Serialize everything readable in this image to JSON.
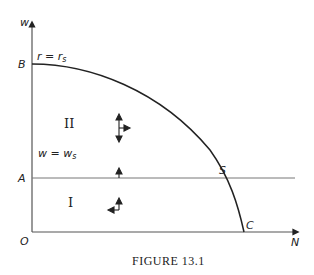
{
  "figure": {
    "caption": "FIGURE 13.1",
    "axes": {
      "y_label": "w",
      "x_label": "N",
      "origin_label": "O"
    },
    "points": {
      "B": "B",
      "A": "A",
      "S": "S",
      "C": "C"
    },
    "curve_label": "r = r",
    "curve_label_sub": "s",
    "line_label": "w = w",
    "line_label_sub": "s",
    "regions": {
      "upper": "II",
      "lower": "I"
    },
    "colors": {
      "ink": "#222222",
      "axis": "#555555",
      "background": "#ffffff"
    }
  }
}
